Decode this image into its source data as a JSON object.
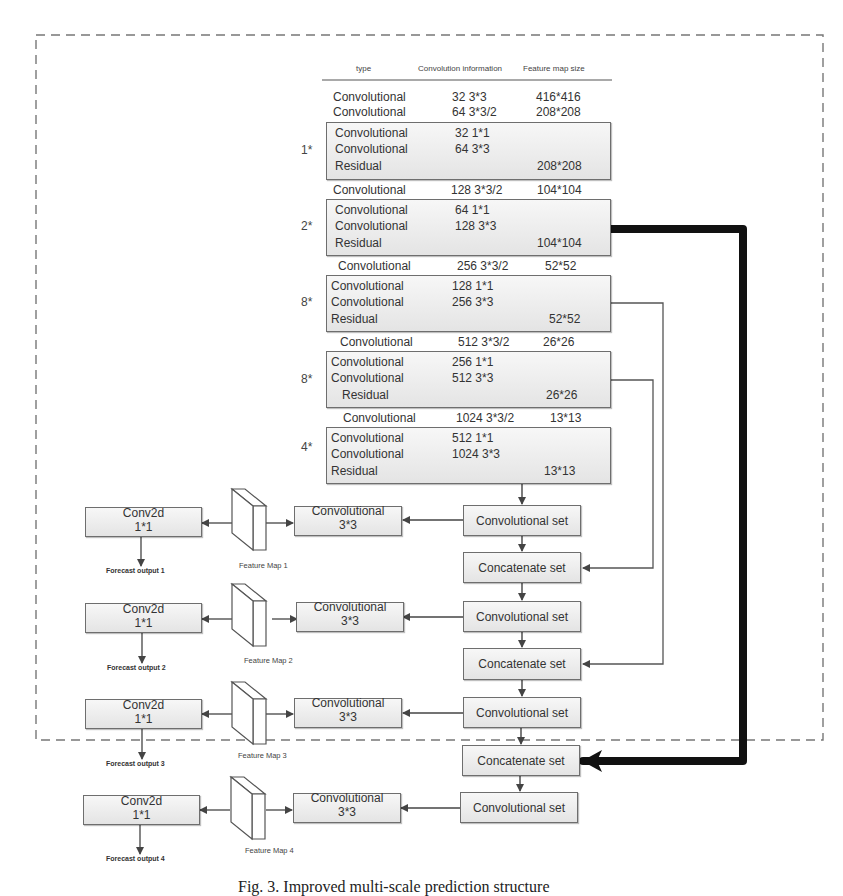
{
  "table": {
    "headers": [
      "type",
      "Convolution information",
      "Feature map size"
    ],
    "rows": [
      {
        "type": "Convolutional",
        "info": "32  3*3",
        "size": "416*416"
      },
      {
        "type": "Convolutional",
        "info": "64  3*3/2",
        "size": "208*208"
      }
    ]
  },
  "blocks": [
    {
      "repeat": "1*",
      "rows": [
        {
          "type": "Convolutional",
          "info": "32  1*1",
          "size": ""
        },
        {
          "type": "Convolutional",
          "info": "64  3*3",
          "size": ""
        },
        {
          "type": "Residual",
          "info": "",
          "size": "208*208"
        }
      ]
    },
    {
      "between": {
        "type": "Convolutional",
        "info": "128  3*3/2",
        "size": "104*104"
      }
    },
    {
      "repeat": "2*",
      "rows": [
        {
          "type": "Convolutional",
          "info": "64  1*1",
          "size": ""
        },
        {
          "type": "Convolutional",
          "info": "128  3*3",
          "size": ""
        },
        {
          "type": "Residual",
          "info": "",
          "size": "104*104"
        }
      ]
    },
    {
      "between": {
        "type": "Convolutional",
        "info": "256  3*3/2",
        "size": "52*52"
      }
    },
    {
      "repeat": "8*",
      "rows": [
        {
          "type": "Convolutional",
          "info": "128  1*1",
          "size": ""
        },
        {
          "type": "Convolutional",
          "info": "256  3*3",
          "size": ""
        },
        {
          "type": "Residual",
          "info": "",
          "size": "52*52"
        }
      ]
    },
    {
      "between": {
        "type": "Convolutional",
        "info": "512  3*3/2",
        "size": "26*26"
      }
    },
    {
      "repeat": "8*",
      "rows": [
        {
          "type": "Convolutional",
          "info": "256  1*1",
          "size": ""
        },
        {
          "type": "Convolutional",
          "info": "512  3*3",
          "size": ""
        },
        {
          "type": "Residual",
          "info": "",
          "size": "26*26"
        }
      ]
    },
    {
      "between": {
        "type": "Convolutional",
        "info": "1024  3*3/2",
        "size": "13*13"
      }
    },
    {
      "repeat": "4*",
      "rows": [
        {
          "type": "Convolutional",
          "info": "512  1*1",
          "size": ""
        },
        {
          "type": "Convolutional",
          "info": "1024  3*3",
          "size": ""
        },
        {
          "type": "Residual",
          "info": "",
          "size": "13*13"
        }
      ]
    }
  ],
  "pipeline": {
    "conv_set": "Convolutional set",
    "concat_set": "Concatenate set",
    "conv33_line1": "Convolutional",
    "conv33_line2": "3*3",
    "conv2d_line1": "Conv2d",
    "conv2d_line2": "1*1",
    "feature_maps": [
      "Feature Map 1",
      "Feature Map 2",
      "Feature Map 3",
      "Feature Map 4"
    ],
    "outputs": [
      "Forecast output 1",
      "Forecast output 2",
      "Forecast output 3",
      "Forecast output 4"
    ]
  },
  "caption": "Fig. 3.  Improved multi-scale prediction structure"
}
